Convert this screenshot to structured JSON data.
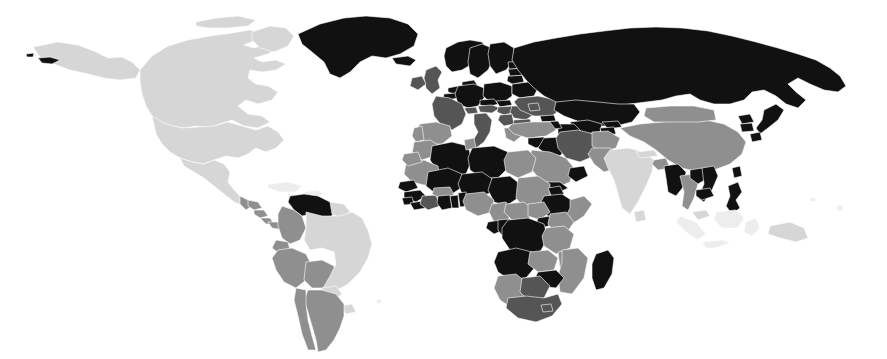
{
  "figure": {
    "kind": "choropleth-world-map",
    "title": "",
    "subtitle": "",
    "background_color": "#ffffff",
    "border_color": "#ffffff",
    "width_px": 887,
    "height_px": 359,
    "projection": "equirectangular",
    "has_legend": false,
    "has_axes": false,
    "has_gridlines": false,
    "has_labels": false
  },
  "palette": {
    "no_data": "#ffffff",
    "very_light": "#ededed",
    "light": "#d6d6d6",
    "medium": "#8f8f8f",
    "dark": "#555555",
    "black": "#111111",
    "outline": "#ffffff"
  },
  "legend": {
    "visible": false,
    "bins": [
      {
        "key": "black",
        "label": "Highest",
        "color": "#111111"
      },
      {
        "key": "dark",
        "label": "High",
        "color": "#555555"
      },
      {
        "key": "medium",
        "label": "Medium",
        "color": "#8f8f8f"
      },
      {
        "key": "light",
        "label": "Low",
        "color": "#d6d6d6"
      },
      {
        "key": "very_light",
        "label": "Lowest",
        "color": "#ededed"
      },
      {
        "key": "no_data",
        "label": "No data",
        "color": "#ffffff"
      }
    ]
  },
  "chart_data": {
    "type": "heatmap",
    "title": "",
    "xlabel": "",
    "ylabel": "",
    "legend_position": "none",
    "grid": false,
    "categories": [
      "black",
      "dark",
      "medium",
      "light",
      "very_light",
      "no_data"
    ],
    "series": [
      {
        "name": "shade_class",
        "values": [
          46,
          17,
          39,
          22,
          9,
          14
        ]
      }
    ],
    "regions": [
      {
        "name": "Greenland",
        "shade": "black"
      },
      {
        "name": "Iceland",
        "shade": "black"
      },
      {
        "name": "Norway",
        "shade": "black"
      },
      {
        "name": "Sweden",
        "shade": "black"
      },
      {
        "name": "Finland",
        "shade": "black"
      },
      {
        "name": "Russia",
        "shade": "black"
      },
      {
        "name": "Estonia",
        "shade": "black"
      },
      {
        "name": "Latvia",
        "shade": "black"
      },
      {
        "name": "Lithuania",
        "shade": "black"
      },
      {
        "name": "Belarus",
        "shade": "black"
      },
      {
        "name": "Poland",
        "shade": "black"
      },
      {
        "name": "Germany",
        "shade": "black"
      },
      {
        "name": "Denmark",
        "shade": "black"
      },
      {
        "name": "Netherlands",
        "shade": "black"
      },
      {
        "name": "Belgium",
        "shade": "black"
      },
      {
        "name": "Czechia",
        "shade": "black"
      },
      {
        "name": "Slovakia",
        "shade": "black"
      },
      {
        "name": "Austria",
        "shade": "dark"
      },
      {
        "name": "Hungary",
        "shade": "dark"
      },
      {
        "name": "Ukraine",
        "shade": "dark"
      },
      {
        "name": "Romania",
        "shade": "dark"
      },
      {
        "name": "Bulgaria",
        "shade": "dark"
      },
      {
        "name": "Serbia",
        "shade": "dark"
      },
      {
        "name": "Greece",
        "shade": "medium"
      },
      {
        "name": "Italy",
        "shade": "dark"
      },
      {
        "name": "Switzerland",
        "shade": "dark"
      },
      {
        "name": "France",
        "shade": "dark"
      },
      {
        "name": "Spain",
        "shade": "medium"
      },
      {
        "name": "Portugal",
        "shade": "medium"
      },
      {
        "name": "United Kingdom",
        "shade": "dark"
      },
      {
        "name": "Ireland",
        "shade": "dark"
      },
      {
        "name": "Turkey",
        "shade": "medium"
      },
      {
        "name": "Georgia",
        "shade": "black"
      },
      {
        "name": "Kazakhstan",
        "shade": "black"
      },
      {
        "name": "Uzbekistan",
        "shade": "black"
      },
      {
        "name": "Turkmenistan",
        "shade": "black"
      },
      {
        "name": "Iran",
        "shade": "dark"
      },
      {
        "name": "Iraq",
        "shade": "black"
      },
      {
        "name": "Syria",
        "shade": "black"
      },
      {
        "name": "Saudi Arabia",
        "shade": "medium"
      },
      {
        "name": "Yemen",
        "shade": "black"
      },
      {
        "name": "Oman",
        "shade": "black"
      },
      {
        "name": "Afghanistan",
        "shade": "medium"
      },
      {
        "name": "Pakistan",
        "shade": "medium"
      },
      {
        "name": "India",
        "shade": "light"
      },
      {
        "name": "Nepal",
        "shade": "light"
      },
      {
        "name": "Bangladesh",
        "shade": "medium"
      },
      {
        "name": "Myanmar",
        "shade": "black"
      },
      {
        "name": "Thailand",
        "shade": "medium"
      },
      {
        "name": "Vietnam",
        "shade": "black"
      },
      {
        "name": "Laos",
        "shade": "black"
      },
      {
        "name": "Cambodia",
        "shade": "black"
      },
      {
        "name": "Malaysia",
        "shade": "light"
      },
      {
        "name": "Indonesia",
        "shade": "very_light"
      },
      {
        "name": "Philippines",
        "shade": "black"
      },
      {
        "name": "China",
        "shade": "medium"
      },
      {
        "name": "Mongolia",
        "shade": "medium"
      },
      {
        "name": "Japan",
        "shade": "black"
      },
      {
        "name": "South Korea",
        "shade": "black"
      },
      {
        "name": "North Korea",
        "shade": "black"
      },
      {
        "name": "Taiwan",
        "shade": "black"
      },
      {
        "name": "United States",
        "shade": "light"
      },
      {
        "name": "Alaska",
        "shade": "light"
      },
      {
        "name": "Canada",
        "shade": "light"
      },
      {
        "name": "Mexico",
        "shade": "light"
      },
      {
        "name": "Guatemala",
        "shade": "medium"
      },
      {
        "name": "Honduras",
        "shade": "medium"
      },
      {
        "name": "Nicaragua",
        "shade": "medium"
      },
      {
        "name": "Costa Rica",
        "shade": "medium"
      },
      {
        "name": "Panama",
        "shade": "medium"
      },
      {
        "name": "Cuba",
        "shade": "very_light"
      },
      {
        "name": "Venezuela",
        "shade": "black"
      },
      {
        "name": "Colombia",
        "shade": "medium"
      },
      {
        "name": "Ecuador",
        "shade": "medium"
      },
      {
        "name": "Peru",
        "shade": "medium"
      },
      {
        "name": "Bolivia",
        "shade": "medium"
      },
      {
        "name": "Brazil",
        "shade": "light"
      },
      {
        "name": "Paraguay",
        "shade": "light"
      },
      {
        "name": "Uruguay",
        "shade": "light"
      },
      {
        "name": "Argentina",
        "shade": "medium"
      },
      {
        "name": "Chile",
        "shade": "medium"
      },
      {
        "name": "Guyana",
        "shade": "light"
      },
      {
        "name": "Morocco",
        "shade": "medium"
      },
      {
        "name": "Algeria",
        "shade": "black"
      },
      {
        "name": "Tunisia",
        "shade": "medium"
      },
      {
        "name": "Libya",
        "shade": "black"
      },
      {
        "name": "Egypt",
        "shade": "medium"
      },
      {
        "name": "Sudan",
        "shade": "medium"
      },
      {
        "name": "Mauritania",
        "shade": "medium"
      },
      {
        "name": "Mali",
        "shade": "black"
      },
      {
        "name": "Niger",
        "shade": "black"
      },
      {
        "name": "Chad",
        "shade": "black"
      },
      {
        "name": "Senegal",
        "shade": "black"
      },
      {
        "name": "Guinea",
        "shade": "black"
      },
      {
        "name": "Sierra Leone",
        "shade": "black"
      },
      {
        "name": "Liberia",
        "shade": "black"
      },
      {
        "name": "Ivory Coast",
        "shade": "dark"
      },
      {
        "name": "Ghana",
        "shade": "black"
      },
      {
        "name": "Burkina Faso",
        "shade": "medium"
      },
      {
        "name": "Benin",
        "shade": "black"
      },
      {
        "name": "Togo",
        "shade": "black"
      },
      {
        "name": "Nigeria",
        "shade": "medium"
      },
      {
        "name": "Cameroon",
        "shade": "medium"
      },
      {
        "name": "Central African Republic",
        "shade": "medium"
      },
      {
        "name": "Ethiopia",
        "shade": "black"
      },
      {
        "name": "Eritrea",
        "shade": "black"
      },
      {
        "name": "Somalia",
        "shade": "medium"
      },
      {
        "name": "Kenya",
        "shade": "medium"
      },
      {
        "name": "Uganda",
        "shade": "black"
      },
      {
        "name": "Tanzania",
        "shade": "medium"
      },
      {
        "name": "DR Congo",
        "shade": "black"
      },
      {
        "name": "Congo",
        "shade": "black"
      },
      {
        "name": "Gabon",
        "shade": "black"
      },
      {
        "name": "Angola",
        "shade": "black"
      },
      {
        "name": "Zambia",
        "shade": "medium"
      },
      {
        "name": "Zimbabwe",
        "shade": "black"
      },
      {
        "name": "Mozambique",
        "shade": "medium"
      },
      {
        "name": "Namibia",
        "shade": "medium"
      },
      {
        "name": "Botswana",
        "shade": "dark"
      },
      {
        "name": "South Africa",
        "shade": "dark"
      },
      {
        "name": "Lesotho",
        "shade": "dark"
      },
      {
        "name": "Madagascar",
        "shade": "black"
      },
      {
        "name": "Australia",
        "shade": "no_data"
      },
      {
        "name": "New Zealand",
        "shade": "no_data"
      },
      {
        "name": "Papua New Guinea",
        "shade": "light"
      },
      {
        "name": "Antarctica",
        "shade": "no_data"
      }
    ]
  }
}
